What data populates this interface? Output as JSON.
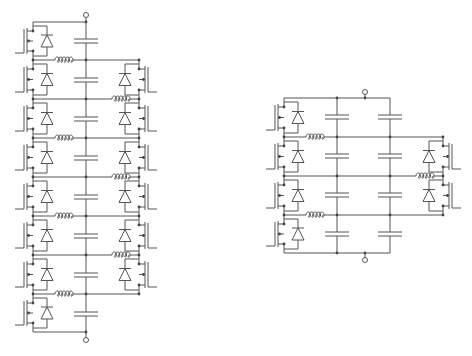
{
  "diagram": {
    "type": "circuit-schematic",
    "stroke_color": "#555555",
    "node_color": "#444444",
    "background": "#ffffff"
  },
  "left_circuit": {
    "name": "flying-capacitor-multilevel-converter-8-cell",
    "terminal_top": {
      "x": 86,
      "y": 15
    },
    "terminal_bottom": {
      "x": 86,
      "y": 340
    },
    "left_rail_x": 33,
    "center_x": 86,
    "right_rail_x": 139,
    "row_lines_y": [
      22,
      60,
      99,
      138,
      177,
      216,
      255,
      294,
      332
    ],
    "capacitors_y": [
      41,
      80,
      119,
      158,
      197,
      236,
      275,
      314
    ],
    "left_switch_cells": [
      0,
      1,
      2,
      3,
      4,
      5,
      6,
      7
    ],
    "right_switch_cells": [
      1,
      2,
      3,
      4,
      5,
      6
    ],
    "inductors": [
      {
        "side": "left",
        "y": 60,
        "x": 55
      },
      {
        "side": "right",
        "y": 99,
        "x": 112
      },
      {
        "side": "left",
        "y": 138,
        "x": 55
      },
      {
        "side": "right",
        "y": 177,
        "x": 112
      },
      {
        "side": "left",
        "y": 216,
        "x": 55
      },
      {
        "side": "right",
        "y": 255,
        "x": 112
      },
      {
        "side": "left",
        "y": 294,
        "x": 55
      }
    ]
  },
  "right_circuit": {
    "name": "flying-capacitor-multilevel-converter-4-cell",
    "terminal_top": {
      "x": 365,
      "y": 92
    },
    "terminal_bottom": {
      "x": 365,
      "y": 260
    },
    "left_rail_x": 284,
    "cap_columns_x": [
      337,
      390
    ],
    "right_rail_x": 443,
    "row_lines_y": [
      98,
      137,
      176,
      215,
      253
    ],
    "capacitors_y": [
      117,
      156,
      195,
      234
    ],
    "left_switch_cells": [
      0,
      1,
      2,
      3
    ],
    "right_switch_cells": [
      1,
      2
    ],
    "inductors": [
      {
        "side": "left",
        "y": 137,
        "x": 306
      },
      {
        "side": "right",
        "y": 176,
        "x": 416
      },
      {
        "side": "left",
        "y": 215,
        "x": 306
      }
    ]
  }
}
